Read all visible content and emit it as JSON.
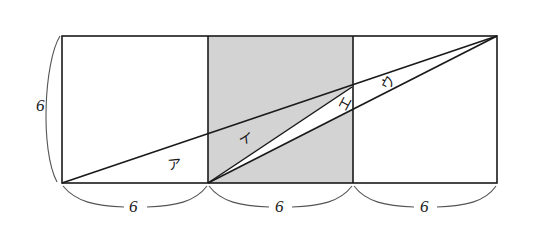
{
  "figure": {
    "background_color": "#ffffff",
    "stroke_color": "#1a1a1a",
    "shade_color": "#d3d3d3",
    "brace_color": "#555555",
    "squares": [
      {
        "name": "left-square",
        "x": 62,
        "y": 36,
        "size": 146,
        "shaded": false
      },
      {
        "name": "middle-square",
        "x": 208,
        "y": 36,
        "size": 145,
        "shaded": true
      },
      {
        "name": "right-square",
        "x": 353,
        "y": 36,
        "size": 144,
        "shaded": false
      }
    ],
    "dimension_labels": {
      "left_height": "6",
      "bottom_first": "6",
      "bottom_second": "6",
      "bottom_third": "6"
    },
    "region_labels": {
      "a": "ア",
      "b": "イ",
      "c": "ウ",
      "d": "エ"
    },
    "lines": [
      {
        "name": "main-diagonal",
        "from": [
          62,
          183
        ],
        "to": [
          497,
          36
        ]
      },
      {
        "name": "secondary-diagonal",
        "from": [
          208,
          183
        ],
        "to": [
          497,
          36
        ]
      },
      {
        "name": "short-diagonal",
        "from": [
          208,
          183
        ],
        "to": [
          352,
          87
        ]
      }
    ]
  }
}
